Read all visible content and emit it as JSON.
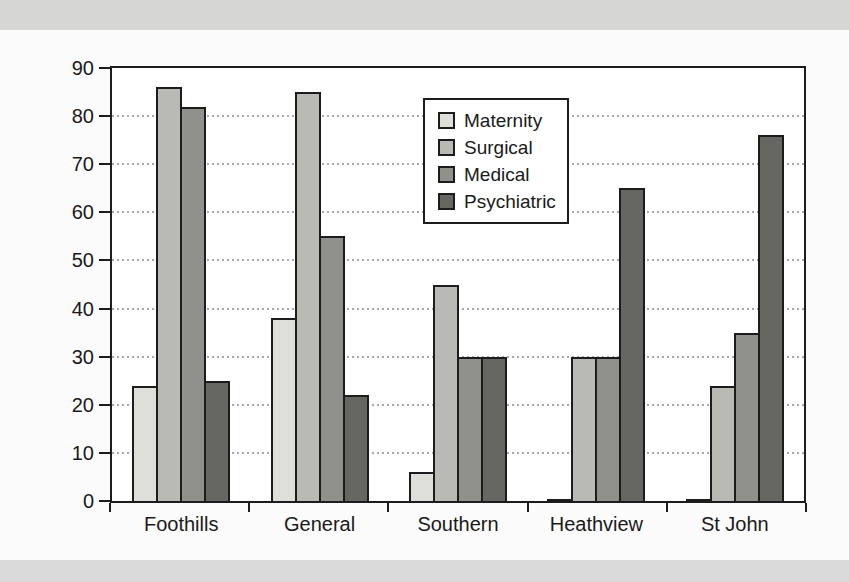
{
  "chart_data": {
    "type": "bar",
    "title": "",
    "xlabel": "",
    "ylabel": "",
    "categories": [
      "Foothills",
      "General",
      "Southern",
      "Heathview",
      "St John"
    ],
    "series": [
      {
        "name": "Maternity",
        "color": "#dededa",
        "values": [
          24,
          38,
          6,
          0.5,
          0.5
        ]
      },
      {
        "name": "Surgical",
        "color": "#b9b9b5",
        "values": [
          86,
          85,
          45,
          30,
          24
        ]
      },
      {
        "name": "Medical",
        "color": "#90908c",
        "values": [
          82,
          55,
          30,
          30,
          35
        ]
      },
      {
        "name": "Psychiatric",
        "color": "#666662",
        "values": [
          25,
          22,
          30,
          65,
          76
        ]
      }
    ],
    "ylim": [
      0,
      90
    ],
    "ytick_step": 10,
    "grid": "horizontal-dotted",
    "legend_position": "inside-top-center"
  },
  "colors": {
    "page_bg": "#fbfbfb",
    "band_top": "#d6d6d4",
    "band_bottom": "#dadada",
    "plot_bg": "#ffffff",
    "axis": "#1c1c1c",
    "gridline": "#a8a8a8",
    "text": "#1a1a1a"
  }
}
